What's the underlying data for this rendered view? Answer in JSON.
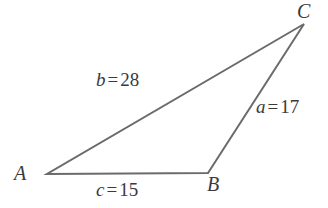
{
  "figure": {
    "type": "triangle-diagram",
    "background_color": "#ffffff",
    "stroke_color": "#6b6b6b",
    "text_color": "#3a3a3a",
    "stroke_width": 2
  },
  "vertices": [
    {
      "name": "A",
      "label": "A",
      "x": 47,
      "y": 174
    },
    {
      "name": "B",
      "label": "B",
      "x": 208,
      "y": 173
    },
    {
      "name": "C",
      "label": "C",
      "x": 304,
      "y": 24
    }
  ],
  "sides": [
    {
      "name": "a",
      "var": "a",
      "equals": "=",
      "value": "17",
      "full_text": "a = 17",
      "between": "B-C"
    },
    {
      "name": "b",
      "var": "b",
      "equals": "=",
      "value": "28",
      "full_text": "b = 28",
      "between": "A-C"
    },
    {
      "name": "c",
      "var": "c",
      "equals": "=",
      "value": "15",
      "full_text": "c = 15",
      "between": "A-B"
    }
  ],
  "chart_data": {
    "type": "diagram",
    "title": "",
    "shape": "triangle",
    "labels": [
      "A",
      "B",
      "C"
    ],
    "side_labels": [
      "a = 17",
      "b = 28",
      "c = 15"
    ],
    "side_values": [
      17,
      28,
      15
    ],
    "points": [
      [
        47,
        174
      ],
      [
        208,
        173
      ],
      [
        304,
        24
      ]
    ]
  }
}
